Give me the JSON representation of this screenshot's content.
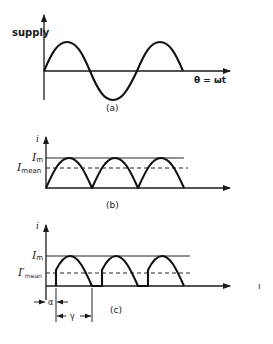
{
  "figure": {
    "panel_a": {
      "caption": "(a)",
      "y_label": "supply",
      "x_label": "θ = ωt",
      "waveform": "sine, ~1.5 cycles"
    },
    "panel_b": {
      "caption": "(b)",
      "y_label": "i",
      "level_max_label": "I",
      "level_max_sub": "m",
      "level_mean_label": "I",
      "level_mean_sub": "mean",
      "waveform": "full-wave rectified sine, 3 humps"
    },
    "panel_c": {
      "caption": "(c)",
      "y_label": "i",
      "level_max_label": "I",
      "level_max_sub": "m",
      "level_mean_label": "I′",
      "level_mean_sub": "mean",
      "alpha_label": "α",
      "gamma_label": "γ",
      "waveform": "phase-controlled rectified sine, 3 humps with delay α and conduction γ"
    },
    "stray_mark": "ı"
  }
}
